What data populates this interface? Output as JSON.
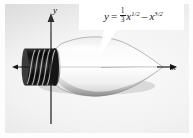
{
  "figure": {
    "name": "lightbulb-volume-of-revolution-diagram",
    "background_color": "#e9e9e9",
    "plate_border_color": "#ffffff"
  },
  "equation": {
    "lhs": "y",
    "equals": "=",
    "fraction_numerator": "1",
    "fraction_denominator": "3",
    "term1_base": "x",
    "term1_exponent": "1/2",
    "minus": "–",
    "term2_base": "x",
    "term2_exponent": "3/2",
    "plain_text": "y = 1/3 x^(1/2) - x^(3/2)"
  },
  "axes": {
    "x_label": "x",
    "y_label": "y",
    "axis_color": "#1a1a1a",
    "origin_x_px": 46,
    "origin_y_px": 67
  },
  "objects": {
    "bulb_label": "light-bulb",
    "bulb_glass_color": "#f7f7f7",
    "bulb_shadow_color": "#a9a9a9",
    "screw_base_label": "threaded-screw-base",
    "screw_base_color": "#1d1d1d",
    "tip_label": "bulb-tip"
  },
  "callout": {
    "box_color": "#ffffff",
    "leader_label": "callout-leader-line"
  }
}
